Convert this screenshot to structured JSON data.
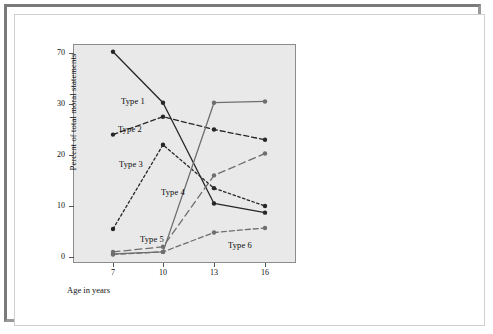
{
  "figure": {
    "background_color": "#ffffff",
    "frame_color": "#7a7a7a",
    "plot_background_color": "#e9e9e9",
    "plot_border_color": "#8c8c8c"
  },
  "chart_data": {
    "type": "line",
    "title": "",
    "subtitle": "",
    "xlabel": "Age in years",
    "ylabel": "Percent of total moral statements",
    "x": [
      7,
      10,
      13,
      16
    ],
    "categories": [
      "7",
      "10",
      "13",
      "16"
    ],
    "xtick_labels": [
      "7",
      "10",
      "13",
      "16"
    ],
    "ytick_labels": [
      "0",
      "10",
      "20",
      "30",
      "70"
    ],
    "ytick_values": [
      0,
      10,
      20,
      30,
      70
    ],
    "ylim": [
      0,
      70
    ],
    "xlim": [
      7,
      16
    ],
    "axis_note": "y-axis compressed above 30",
    "grid": false,
    "legend_position": "inline-annotations",
    "series": [
      {
        "name": "Type 1",
        "values": [
          71,
          31,
          10.5,
          8.7
        ],
        "color": "#262626",
        "dash": "solid",
        "marker": "circle"
      },
      {
        "name": "Type 2",
        "values": [
          24,
          27.5,
          25,
          23
        ],
        "color": "#262626",
        "dash": "dashed",
        "marker": "circle"
      },
      {
        "name": "Type 3",
        "values": [
          5.5,
          22,
          13.5,
          10
        ],
        "color": "#262626",
        "dash": "dotted",
        "marker": "circle"
      },
      {
        "name": "Type 4",
        "values": [
          0.6,
          1,
          31,
          32
        ],
        "color": "#6e6e6e",
        "dash": "solid",
        "marker": "circle"
      },
      {
        "name": "Type 5",
        "values": [
          1,
          2,
          16,
          20.3
        ],
        "color": "#6e6e6e",
        "dash": "long-dash",
        "marker": "circle"
      },
      {
        "name": "Type 6",
        "values": [
          0.5,
          1,
          4.8,
          5.7
        ],
        "color": "#6e6e6e",
        "dash": "dashed",
        "marker": "circle"
      }
    ],
    "annotations": [
      {
        "text": "Type 1",
        "x_px": 121,
        "y_px": 96
      },
      {
        "text": "Type 2",
        "x_px": 118,
        "y_px": 124
      },
      {
        "text": "Type 3",
        "x_px": 119,
        "y_px": 159
      },
      {
        "text": "Type 4",
        "x_px": 161,
        "y_px": 187
      },
      {
        "text": "Type 5",
        "x_px": 140,
        "y_px": 234
      },
      {
        "text": "Type 6",
        "x_px": 228,
        "y_px": 240
      }
    ]
  }
}
